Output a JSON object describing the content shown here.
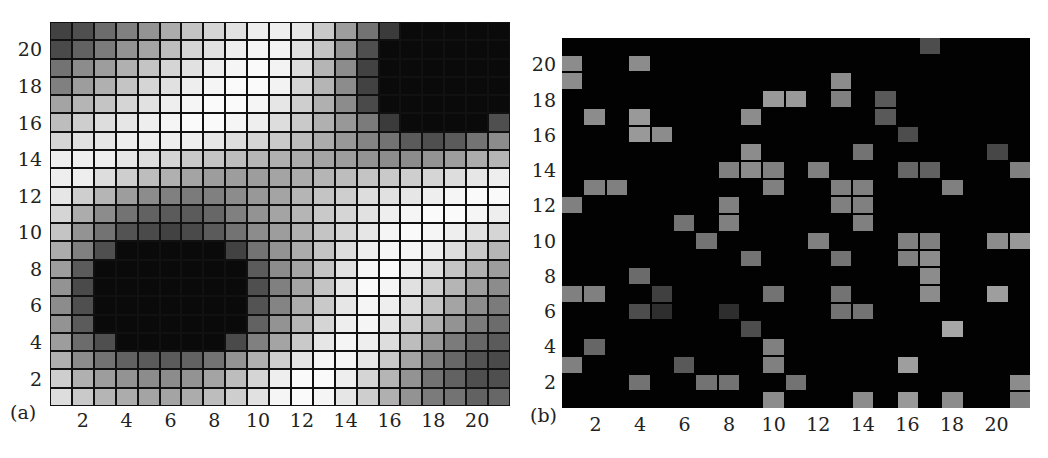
{
  "chart_data": [
    {
      "panel": "(a)",
      "type": "heatmap",
      "title": "",
      "xlabel": "",
      "ylabel": "",
      "x_ticks": [
        2,
        4,
        6,
        8,
        10,
        12,
        14,
        16,
        18,
        20
      ],
      "y_ticks": [
        2,
        4,
        6,
        8,
        10,
        12,
        14,
        16,
        18,
        20
      ],
      "xlim": [
        1,
        21
      ],
      "ylim": [
        1,
        21
      ],
      "grid": true,
      "colormap": "grayscale (black = low, white = high)",
      "description": "21x21 grid; dark region centered near (6,6) spanning cols 4-9 rows 3-8; dark region top-right spanning cols 16-21 rows 15-21; light diagonal band from upper-left to lower-right",
      "rows_top_to_bottom": [
        [
          0.25,
          0.3,
          0.42,
          0.5,
          0.58,
          0.68,
          0.78,
          0.85,
          0.9,
          0.95,
          0.95,
          0.92,
          0.8,
          0.62,
          0.45,
          0.22,
          0.02,
          0.02,
          0.02,
          0.02,
          0.02
        ],
        [
          0.28,
          0.38,
          0.48,
          0.58,
          0.65,
          0.75,
          0.85,
          0.9,
          0.95,
          0.98,
          0.97,
          0.9,
          0.78,
          0.58,
          0.3,
          0.02,
          0.02,
          0.02,
          0.02,
          0.02,
          0.02
        ],
        [
          0.45,
          0.55,
          0.62,
          0.7,
          0.78,
          0.85,
          0.9,
          0.95,
          0.98,
          1.0,
          0.97,
          0.88,
          0.72,
          0.55,
          0.25,
          0.02,
          0.02,
          0.02,
          0.02,
          0.02,
          0.02
        ],
        [
          0.5,
          0.62,
          0.7,
          0.78,
          0.85,
          0.9,
          0.95,
          0.98,
          1.0,
          1.0,
          0.97,
          0.85,
          0.72,
          0.55,
          0.25,
          0.02,
          0.02,
          0.02,
          0.02,
          0.02,
          0.02
        ],
        [
          0.65,
          0.72,
          0.78,
          0.85,
          0.9,
          0.95,
          0.98,
          1.0,
          1.0,
          0.98,
          0.92,
          0.82,
          0.7,
          0.55,
          0.28,
          0.02,
          0.02,
          0.02,
          0.02,
          0.02,
          0.02
        ],
        [
          0.75,
          0.82,
          0.88,
          0.92,
          0.95,
          0.98,
          1.0,
          1.0,
          0.98,
          0.95,
          0.88,
          0.8,
          0.7,
          0.6,
          0.48,
          0.22,
          0.02,
          0.02,
          0.02,
          0.02,
          0.3
        ],
        [
          0.85,
          0.9,
          0.92,
          0.95,
          0.95,
          0.95,
          0.95,
          0.92,
          0.88,
          0.85,
          0.8,
          0.75,
          0.68,
          0.6,
          0.52,
          0.45,
          0.35,
          0.3,
          0.35,
          0.45,
          0.55
        ],
        [
          0.95,
          0.95,
          0.95,
          0.92,
          0.88,
          0.85,
          0.8,
          0.78,
          0.75,
          0.72,
          0.7,
          0.68,
          0.65,
          0.62,
          0.58,
          0.55,
          0.55,
          0.58,
          0.62,
          0.68,
          0.72
        ],
        [
          0.95,
          0.95,
          0.88,
          0.82,
          0.75,
          0.7,
          0.65,
          0.62,
          0.62,
          0.62,
          0.65,
          0.68,
          0.72,
          0.75,
          0.78,
          0.8,
          0.82,
          0.85,
          0.88,
          0.92,
          0.95
        ],
        [
          0.92,
          0.82,
          0.72,
          0.62,
          0.55,
          0.5,
          0.48,
          0.5,
          0.55,
          0.6,
          0.65,
          0.72,
          0.78,
          0.82,
          0.88,
          0.9,
          0.92,
          0.95,
          0.98,
          1.0,
          1.0
        ],
        [
          0.85,
          0.68,
          0.55,
          0.45,
          0.38,
          0.35,
          0.35,
          0.4,
          0.5,
          0.58,
          0.65,
          0.72,
          0.8,
          0.85,
          0.9,
          0.95,
          0.98,
          1.0,
          1.0,
          0.98,
          0.95
        ],
        [
          0.78,
          0.58,
          0.45,
          0.32,
          0.28,
          0.25,
          0.28,
          0.35,
          0.45,
          0.55,
          0.62,
          0.7,
          0.78,
          0.85,
          0.92,
          0.98,
          1.0,
          0.98,
          0.95,
          0.9,
          0.85
        ],
        [
          0.68,
          0.5,
          0.3,
          0.02,
          0.02,
          0.02,
          0.02,
          0.02,
          0.25,
          0.45,
          0.58,
          0.68,
          0.78,
          0.88,
          0.95,
          0.98,
          0.98,
          0.95,
          0.88,
          0.8,
          0.72
        ],
        [
          0.62,
          0.35,
          0.02,
          0.02,
          0.02,
          0.02,
          0.02,
          0.02,
          0.02,
          0.35,
          0.55,
          0.65,
          0.78,
          0.9,
          0.98,
          1.0,
          0.95,
          0.88,
          0.78,
          0.7,
          0.62
        ],
        [
          0.58,
          0.28,
          0.02,
          0.02,
          0.02,
          0.02,
          0.02,
          0.02,
          0.02,
          0.3,
          0.5,
          0.65,
          0.78,
          0.92,
          1.0,
          0.98,
          0.9,
          0.82,
          0.72,
          0.62,
          0.55
        ],
        [
          0.55,
          0.3,
          0.02,
          0.02,
          0.02,
          0.02,
          0.02,
          0.02,
          0.02,
          0.32,
          0.52,
          0.68,
          0.8,
          0.92,
          0.98,
          0.95,
          0.88,
          0.78,
          0.65,
          0.55,
          0.48
        ],
        [
          0.58,
          0.35,
          0.02,
          0.02,
          0.02,
          0.02,
          0.02,
          0.02,
          0.02,
          0.38,
          0.58,
          0.72,
          0.85,
          0.95,
          0.98,
          0.92,
          0.82,
          0.7,
          0.58,
          0.48,
          0.42
        ],
        [
          0.62,
          0.42,
          0.3,
          0.02,
          0.02,
          0.02,
          0.02,
          0.02,
          0.28,
          0.5,
          0.65,
          0.8,
          0.92,
          0.98,
          0.95,
          0.88,
          0.75,
          0.6,
          0.48,
          0.4,
          0.35
        ],
        [
          0.7,
          0.55,
          0.45,
          0.38,
          0.35,
          0.35,
          0.38,
          0.45,
          0.58,
          0.7,
          0.82,
          0.92,
          0.98,
          0.98,
          0.92,
          0.8,
          0.65,
          0.5,
          0.4,
          0.32,
          0.28
        ],
        [
          0.82,
          0.7,
          0.62,
          0.58,
          0.55,
          0.55,
          0.58,
          0.65,
          0.75,
          0.85,
          0.95,
          1.0,
          1.0,
          0.95,
          0.85,
          0.72,
          0.58,
          0.45,
          0.38,
          0.3,
          0.3
        ],
        [
          0.88,
          0.8,
          0.72,
          0.68,
          0.65,
          0.65,
          0.68,
          0.75,
          0.82,
          0.9,
          0.98,
          1.0,
          0.98,
          0.92,
          0.82,
          0.7,
          0.58,
          0.48,
          0.45,
          0.38,
          0.4
        ]
      ]
    },
    {
      "panel": "(b)",
      "type": "heatmap",
      "title": "",
      "xlabel": "",
      "ylabel": "",
      "x_ticks": [
        2,
        4,
        6,
        8,
        10,
        12,
        14,
        16,
        18,
        20
      ],
      "y_ticks": [
        2,
        4,
        6,
        8,
        10,
        12,
        14,
        16,
        18,
        20
      ],
      "xlim": [
        1,
        21
      ],
      "ylim": [
        1,
        21
      ],
      "grid": false,
      "background": "black",
      "colormap": "grayscale (black = 0, gray = active)",
      "description": "Sparse binary-like field: mostly black with scattered gray cells",
      "active_cells": [
        {
          "col": 17,
          "row": 21,
          "v": 0.3
        },
        {
          "col": 1,
          "row": 20,
          "v": 0.55
        },
        {
          "col": 4,
          "row": 20,
          "v": 0.55
        },
        {
          "col": 1,
          "row": 19,
          "v": 0.55
        },
        {
          "col": 13,
          "row": 19,
          "v": 0.55
        },
        {
          "col": 10,
          "row": 18,
          "v": 0.6
        },
        {
          "col": 11,
          "row": 18,
          "v": 0.6
        },
        {
          "col": 13,
          "row": 18,
          "v": 0.5
        },
        {
          "col": 15,
          "row": 18,
          "v": 0.35
        },
        {
          "col": 2,
          "row": 17,
          "v": 0.55
        },
        {
          "col": 4,
          "row": 17,
          "v": 0.6
        },
        {
          "col": 9,
          "row": 17,
          "v": 0.55
        },
        {
          "col": 15,
          "row": 17,
          "v": 0.35
        },
        {
          "col": 4,
          "row": 16,
          "v": 0.6
        },
        {
          "col": 5,
          "row": 16,
          "v": 0.55
        },
        {
          "col": 16,
          "row": 16,
          "v": 0.3
        },
        {
          "col": 9,
          "row": 15,
          "v": 0.55
        },
        {
          "col": 14,
          "row": 15,
          "v": 0.45
        },
        {
          "col": 20,
          "row": 15,
          "v": 0.28
        },
        {
          "col": 8,
          "row": 14,
          "v": 0.5
        },
        {
          "col": 9,
          "row": 14,
          "v": 0.55
        },
        {
          "col": 10,
          "row": 14,
          "v": 0.5
        },
        {
          "col": 12,
          "row": 14,
          "v": 0.5
        },
        {
          "col": 16,
          "row": 14,
          "v": 0.4
        },
        {
          "col": 17,
          "row": 14,
          "v": 0.38
        },
        {
          "col": 21,
          "row": 14,
          "v": 0.5
        },
        {
          "col": 2,
          "row": 13,
          "v": 0.5
        },
        {
          "col": 3,
          "row": 13,
          "v": 0.5
        },
        {
          "col": 10,
          "row": 13,
          "v": 0.5
        },
        {
          "col": 13,
          "row": 13,
          "v": 0.5
        },
        {
          "col": 14,
          "row": 13,
          "v": 0.5
        },
        {
          "col": 18,
          "row": 13,
          "v": 0.5
        },
        {
          "col": 1,
          "row": 12,
          "v": 0.5
        },
        {
          "col": 8,
          "row": 12,
          "v": 0.5
        },
        {
          "col": 13,
          "row": 12,
          "v": 0.5
        },
        {
          "col": 14,
          "row": 12,
          "v": 0.5
        },
        {
          "col": 6,
          "row": 11,
          "v": 0.45
        },
        {
          "col": 8,
          "row": 11,
          "v": 0.5
        },
        {
          "col": 14,
          "row": 11,
          "v": 0.5
        },
        {
          "col": 7,
          "row": 10,
          "v": 0.45
        },
        {
          "col": 12,
          "row": 10,
          "v": 0.5
        },
        {
          "col": 16,
          "row": 10,
          "v": 0.5
        },
        {
          "col": 17,
          "row": 10,
          "v": 0.5
        },
        {
          "col": 20,
          "row": 10,
          "v": 0.55
        },
        {
          "col": 21,
          "row": 10,
          "v": 0.6
        },
        {
          "col": 9,
          "row": 9,
          "v": 0.45
        },
        {
          "col": 13,
          "row": 9,
          "v": 0.45
        },
        {
          "col": 16,
          "row": 9,
          "v": 0.5
        },
        {
          "col": 17,
          "row": 9,
          "v": 0.55
        },
        {
          "col": 4,
          "row": 8,
          "v": 0.42
        },
        {
          "col": 17,
          "row": 8,
          "v": 0.55
        },
        {
          "col": 1,
          "row": 7,
          "v": 0.5
        },
        {
          "col": 2,
          "row": 7,
          "v": 0.5
        },
        {
          "col": 5,
          "row": 7,
          "v": 0.25
        },
        {
          "col": 10,
          "row": 7,
          "v": 0.45
        },
        {
          "col": 13,
          "row": 7,
          "v": 0.45
        },
        {
          "col": 17,
          "row": 7,
          "v": 0.55
        },
        {
          "col": 20,
          "row": 7,
          "v": 0.62
        },
        {
          "col": 4,
          "row": 6,
          "v": 0.3
        },
        {
          "col": 5,
          "row": 6,
          "v": 0.18
        },
        {
          "col": 8,
          "row": 6,
          "v": 0.18
        },
        {
          "col": 13,
          "row": 6,
          "v": 0.45
        },
        {
          "col": 14,
          "row": 6,
          "v": 0.45
        },
        {
          "col": 9,
          "row": 5,
          "v": 0.3
        },
        {
          "col": 18,
          "row": 5,
          "v": 0.65
        },
        {
          "col": 2,
          "row": 4,
          "v": 0.4
        },
        {
          "col": 10,
          "row": 4,
          "v": 0.5
        },
        {
          "col": 1,
          "row": 3,
          "v": 0.5
        },
        {
          "col": 6,
          "row": 3,
          "v": 0.35
        },
        {
          "col": 10,
          "row": 3,
          "v": 0.5
        },
        {
          "col": 16,
          "row": 3,
          "v": 0.62
        },
        {
          "col": 4,
          "row": 2,
          "v": 0.45
        },
        {
          "col": 7,
          "row": 2,
          "v": 0.45
        },
        {
          "col": 8,
          "row": 2,
          "v": 0.45
        },
        {
          "col": 11,
          "row": 2,
          "v": 0.45
        },
        {
          "col": 21,
          "row": 2,
          "v": 0.55
        },
        {
          "col": 10,
          "row": 1,
          "v": 0.55
        },
        {
          "col": 14,
          "row": 1,
          "v": 0.55
        },
        {
          "col": 16,
          "row": 1,
          "v": 0.6
        },
        {
          "col": 18,
          "row": 1,
          "v": 0.55
        },
        {
          "col": 21,
          "row": 1,
          "v": 0.5
        }
      ]
    }
  ],
  "panels": {
    "a": {
      "label": "(a)"
    },
    "b": {
      "label": "(b)"
    }
  },
  "ticks": {
    "y": [
      "20",
      "18",
      "16",
      "14",
      "12",
      "10",
      "8",
      "6",
      "4",
      "2"
    ],
    "x": [
      "2",
      "4",
      "6",
      "8",
      "10",
      "12",
      "14",
      "16",
      "18",
      "20"
    ]
  }
}
